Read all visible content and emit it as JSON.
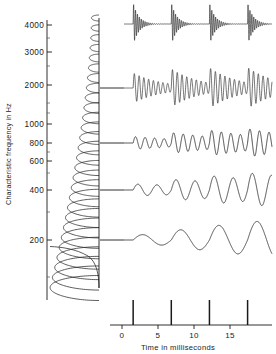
{
  "figure": {
    "title": "",
    "yaxis_label": "Characteristic frequency in Hz",
    "xaxis_label": "Time in milliseconds"
  },
  "chart_data": {
    "type": "line",
    "title": "",
    "xlabel": "Time in milliseconds",
    "ylabel": "Characteristic frequency in Hz",
    "xlim": [
      -2,
      19
    ],
    "ylim": [
      150,
      4600
    ],
    "yscale": "log",
    "grid": false,
    "legend_position": "none",
    "x_ticks": [
      0,
      5,
      10,
      15
    ],
    "x_tick_labels": [
      "0",
      "5",
      "10",
      "15"
    ],
    "y_ticks": [
      200,
      400,
      600,
      800,
      1000,
      2000,
      3000,
      4000
    ],
    "y_tick_labels": [
      "200",
      "400",
      "600",
      "800",
      "1000",
      "2000",
      "3000",
      "4000"
    ],
    "stimulus": {
      "name": "impulse train",
      "impulse_times_ms": [
        0,
        5,
        10,
        15
      ],
      "period_ms": 5,
      "rate_hz": 200
    },
    "filterbank": {
      "description": "impulse responses of auditory filters arrayed along characteristic frequency",
      "channel_count": 28,
      "cf_min_hz": 180,
      "cf_max_hz": 4400
    },
    "series": [
      {
        "name": "4000 Hz channel",
        "cf_hz": 4000,
        "panel_index": 0,
        "ring_frequency_hz": 4000,
        "damping": "high",
        "description": "sharply damped high-frequency bursts, one per impulse"
      },
      {
        "name": "1600 Hz channel",
        "cf_hz": 1600,
        "panel_index": 1,
        "ring_frequency_hz": 1600,
        "damping": "moderate",
        "description": "amplitude-modulated ringing, beats between impulses"
      },
      {
        "name": "800 Hz channel",
        "cf_hz": 800,
        "panel_index": 2,
        "ring_frequency_hz": 800,
        "damping": "low",
        "description": "continuous oscillation with slight modulation"
      },
      {
        "name": "400 Hz channel",
        "cf_hz": 400,
        "panel_index": 3,
        "ring_frequency_hz": 400,
        "damping": "low",
        "description": "smooth sinusoid at roughly 400 Hz"
      },
      {
        "name": "200 Hz channel",
        "cf_hz": 200,
        "panel_index": 4,
        "ring_frequency_hz": 200,
        "damping": "very low",
        "description": "smooth sinusoid locked to the 200 Hz impulse rate"
      }
    ]
  }
}
